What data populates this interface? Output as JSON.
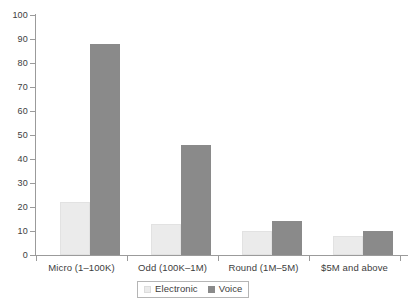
{
  "chart_data": {
    "type": "bar",
    "title": "",
    "subtitle": "",
    "xlabel": "",
    "ylabel": "",
    "ylim": [
      0,
      100
    ],
    "ytick_step": 10,
    "yticks": [
      0,
      10,
      20,
      30,
      40,
      50,
      60,
      70,
      80,
      90,
      100
    ],
    "grid": false,
    "legend_position": "bottom-center",
    "categories": [
      "Micro (1–100K)",
      "Odd (100K–1M)",
      "Round (1M–5M)",
      "$5M and above"
    ],
    "series": [
      {
        "name": "Electronic",
        "color": "#ebebeb",
        "values": [
          22,
          13,
          10,
          8
        ]
      },
      {
        "name": "Voice",
        "color": "#8a8a8a",
        "values": [
          88,
          46,
          14,
          10
        ]
      }
    ]
  },
  "legend": {
    "items": [
      {
        "label": "Electronic",
        "swatch": "electronic"
      },
      {
        "label": "Voice",
        "swatch": "voice"
      }
    ]
  }
}
